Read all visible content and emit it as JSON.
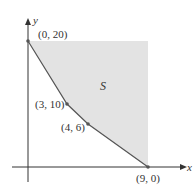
{
  "diagram": {
    "type": "feasible-region",
    "region_label": "S",
    "axes": {
      "x_label": "x",
      "y_label": "y"
    },
    "points": [
      {
        "label": "(0, 20)",
        "x": 0,
        "y": 20
      },
      {
        "label": "(3, 10)",
        "x": 3,
        "y": 10
      },
      {
        "label": "(4, 6)",
        "x": 4,
        "y": 6
      },
      {
        "label": "(9, 0)",
        "x": 9,
        "y": 0
      }
    ],
    "colors": {
      "region_fill": "#e3e3e3",
      "boundary": "#555555",
      "axis": "#333333",
      "text": "#333333"
    }
  }
}
